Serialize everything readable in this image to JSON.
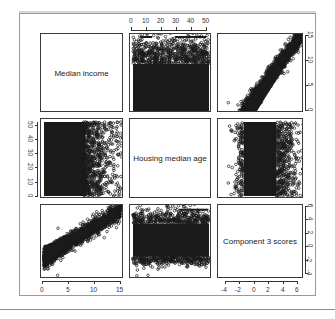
{
  "chart_data": {
    "type": "scatter",
    "title": "",
    "layout": "pairs-matrix",
    "variables": [
      "Median income",
      "Housing median age",
      "Component 3 scores"
    ],
    "axes": {
      "median_income": {
        "range": [
          0,
          15
        ],
        "ticks": [
          0,
          5,
          10,
          15
        ],
        "tick_labels": [
          "0",
          "5",
          "10",
          "15"
        ]
      },
      "housing_median_age": {
        "range": [
          0,
          52
        ],
        "ticks": [
          0,
          10,
          20,
          30,
          40,
          50
        ],
        "tick_labels": [
          "0",
          "10",
          "20",
          "30",
          "40",
          "50"
        ]
      },
      "component_3_scores": {
        "range": [
          -4.5,
          6
        ],
        "ticks": [
          -4,
          -2,
          0,
          2,
          4,
          6
        ],
        "tick_labels": [
          "-4",
          "-2",
          "0",
          "2",
          "4",
          "6"
        ]
      }
    },
    "axis_placement": {
      "top": {
        "column": 2,
        "variable": "Housing median age"
      },
      "right": [
        {
          "row": 1,
          "variable": "Median income",
          "ticks": [
            "0",
            "5",
            "10",
            "15"
          ]
        },
        {
          "row": 3,
          "variable": "Component 3 scores",
          "ticks": [
            "-4",
            "-2",
            "0",
            "2",
            "4",
            "6"
          ]
        }
      ],
      "left": {
        "row": 2,
        "variable": "Housing median age"
      },
      "bottom": [
        {
          "column": 1,
          "variable": "Median income"
        },
        {
          "column": 3,
          "variable": "Component 3 scores"
        }
      ]
    },
    "panels": [
      {
        "row": 1,
        "col": 1,
        "kind": "label",
        "text": "Median income"
      },
      {
        "row": 1,
        "col": 2,
        "kind": "scatter",
        "x": "Housing median age",
        "y": "Median income",
        "pattern": "dense band y 0.5-8, sparse up to 15, flat across x"
      },
      {
        "row": 1,
        "col": 3,
        "kind": "scatter",
        "x": "Component 3 scores",
        "y": "Median income",
        "pattern": "strong positive linear"
      },
      {
        "row": 2,
        "col": 1,
        "kind": "scatter",
        "x": "Median income",
        "y": "Housing median age",
        "pattern": "dense at income 0.5-8, full age range"
      },
      {
        "row": 2,
        "col": 2,
        "kind": "label",
        "text": "Housing median age"
      },
      {
        "row": 2,
        "col": 3,
        "kind": "scatter",
        "x": "Component 3 scores",
        "y": "Housing median age",
        "pattern": "dense at scores -2 to 2, full age range"
      },
      {
        "row": 3,
        "col": 1,
        "kind": "scatter",
        "x": "Median income",
        "y": "Component 3 scores",
        "pattern": "strong positive linear"
      },
      {
        "row": 3,
        "col": 2,
        "kind": "scatter",
        "x": "Housing median age",
        "y": "Component 3 scores",
        "pattern": "dense band -2 to 2, flat across x"
      },
      {
        "row": 3,
        "col": 3,
        "kind": "label",
        "text": "Component 3 scores"
      }
    ],
    "correlation_estimate": {
      "income_vs_component3": 0.95,
      "income_vs_age": -0.1,
      "age_vs_component3": -0.1
    },
    "grid": false,
    "legend": null,
    "marker": {
      "shape": "open-circle",
      "color": "#1a1a1a"
    }
  },
  "labels": {
    "d1": "Median income",
    "d2": "Housing median age",
    "d3": "Component 3 scores"
  },
  "ticks": {
    "top": [
      "0",
      "10",
      "20",
      "30",
      "40",
      "50"
    ],
    "right_row1": [
      "0",
      "5",
      "10",
      "15"
    ],
    "right_row3": [
      "-4",
      "-2",
      "0",
      "2",
      "4",
      "6"
    ],
    "left_row2": [
      "0",
      "10",
      "20",
      "30",
      "40",
      "50"
    ],
    "bottom_col1": [
      "0",
      "5",
      "10",
      "15"
    ],
    "bottom_col3": [
      "-4",
      "-2",
      "0",
      "2",
      "4",
      "6"
    ]
  }
}
